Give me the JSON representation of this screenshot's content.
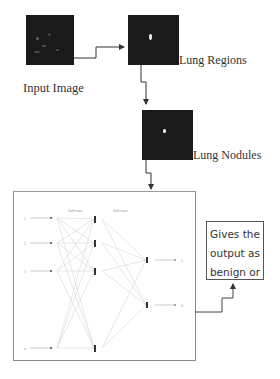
{
  "diagram": {
    "steps": [
      {
        "id": "input",
        "label": "Input Image"
      },
      {
        "id": "regions",
        "label": "Lung Regions"
      },
      {
        "id": "nodules",
        "label": "Lung Nodules"
      }
    ],
    "network": {
      "layer_labels": [
        "Softmax",
        "Softmax"
      ],
      "input_labels": [
        "1",
        "2",
        "3",
        "n"
      ],
      "output_labels": [
        "1",
        "0"
      ]
    },
    "output_box": {
      "lines": [
        "Gives the",
        "output as",
        "benign or",
        "malignant"
      ]
    },
    "colors": {
      "image_bg": "#1a1a1a",
      "line": "#333333",
      "nn_line": "#c8c8c8",
      "box_border": "#8a8a8a"
    }
  }
}
